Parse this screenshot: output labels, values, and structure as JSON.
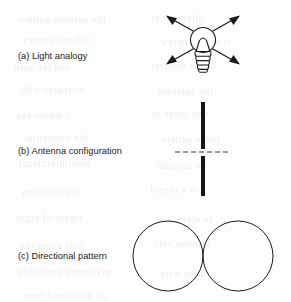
{
  "figure": {
    "caption_style": "lettered-panels",
    "background_color": "#fdfdfd",
    "ink_color": "#1b1b1b",
    "panels": [
      {
        "key": "a",
        "label": "(a) Light analogy",
        "graphic": "lightbulb-with-radiating-arrows",
        "description_semantics": "omnidirectional-radiation"
      },
      {
        "key": "b",
        "label": "(b) Antenna configuration",
        "graphic": "vertical-dipole-with-feed-axis",
        "description_semantics": "half-wave-dipole"
      },
      {
        "key": "c",
        "label": "(c) Directional pattern",
        "graphic": "two-tangent-circles",
        "description_semantics": "figure-eight-pattern"
      }
    ]
  },
  "geometry": {
    "bulb": {
      "center_x": 203,
      "glass_center_y": 40,
      "glass_radius": 12.5,
      "base_top_y": 50,
      "base_bottom_y": 72,
      "base_half_width": 8,
      "thread_count": 5,
      "arrow_count": 4,
      "arrow_inner_radius": 14,
      "arrow_outer_radius": 40
    },
    "dipole": {
      "x": 203,
      "top_y": 102,
      "bottom_y": 196,
      "gap_top_y": 149,
      "gap_bottom_y": 156,
      "stroke_width": 4,
      "feed_line_y": 152,
      "feed_line_x1": 175,
      "feed_line_x2": 231,
      "feed_line_dash": "5 3"
    },
    "pattern": {
      "tangent_x": 203,
      "center_y": 256,
      "radius": 35,
      "left_center_x": 168,
      "right_center_x": 238,
      "stroke_width": 1
    }
  },
  "bleed_text": [
    {
      "x": 18,
      "y": 14,
      "size": 10,
      "text": "the antenna pattern"
    },
    {
      "x": 150,
      "y": 12,
      "size": 10,
      "text": "direction of"
    },
    {
      "x": 22,
      "y": 34,
      "size": 10,
      "text": "radiated energy"
    },
    {
      "x": 160,
      "y": 36,
      "size": 10,
      "text": "is shown below"
    },
    {
      "x": 14,
      "y": 62,
      "size": 10,
      "text": "and the gain"
    },
    {
      "x": 150,
      "y": 60,
      "size": 10,
      "text": "of the element"
    },
    {
      "x": 20,
      "y": 84,
      "size": 10,
      "text": "increases with"
    },
    {
      "x": 158,
      "y": 86,
      "size": 10,
      "text": "the aperture"
    },
    {
      "x": 16,
      "y": 110,
      "size": 10,
      "text": "a dipole has"
    },
    {
      "x": 152,
      "y": 108,
      "size": 10,
      "text": "two lobes in"
    },
    {
      "x": 24,
      "y": 132,
      "size": 10,
      "text": "the horizontal"
    },
    {
      "x": 160,
      "y": 134,
      "size": 10,
      "text": "plane pattern"
    },
    {
      "x": 18,
      "y": 158,
      "size": 10,
      "text": "omnidirectional"
    },
    {
      "x": 156,
      "y": 160,
      "size": 10,
      "text": "in azimuth"
    },
    {
      "x": 22,
      "y": 186,
      "size": 10,
      "text": "the radiation"
    },
    {
      "x": 150,
      "y": 184,
      "size": 10,
      "text": "is a toroid"
    },
    {
      "x": 16,
      "y": 212,
      "size": 10,
      "text": "figure of eight"
    },
    {
      "x": 158,
      "y": 214,
      "size": 10,
      "text": "in elevation"
    },
    {
      "x": 20,
      "y": 240,
      "size": 10,
      "text": "null along the"
    },
    {
      "x": 154,
      "y": 238,
      "size": 10,
      "text": "antenna axis"
    },
    {
      "x": 18,
      "y": 266,
      "size": 10,
      "text": "maximum broadside"
    },
    {
      "x": 160,
      "y": 268,
      "size": 10,
      "text": "to the wire"
    },
    {
      "x": 24,
      "y": 290,
      "size": 10,
      "text": "as illustrated here"
    }
  ]
}
